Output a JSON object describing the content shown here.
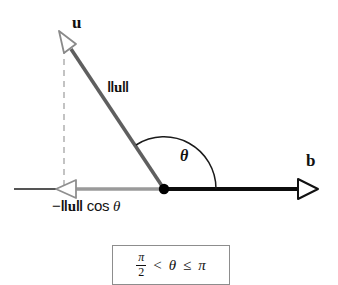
{
  "figure": {
    "type": "vector-angle-diagram",
    "background_color": "#ffffff",
    "labels": {
      "vector_u": "u",
      "vector_b": "b",
      "magnitude_u": "‖u‖",
      "angle": "θ",
      "projection": "−‖u‖ cos θ"
    },
    "projection_label_parts": {
      "minus": "−",
      "left_bar": "‖",
      "u": "u",
      "right_bar": "‖",
      "cos": " cos ",
      "theta": "θ"
    },
    "magnitude_label_parts": {
      "left_bar": "‖",
      "u": "u",
      "right_bar": "‖"
    },
    "condition": {
      "numerator": "π",
      "denominator": "2",
      "less_than": "<",
      "theta": "θ",
      "less_equal": "≤",
      "pi": "π"
    },
    "colors": {
      "vector_u_line": "#5f5f5f",
      "axis_black": "#0d0d0d",
      "projection_gray": "#9a9a9a",
      "dashed_gray": "#b5b5b5",
      "arc_black": "#1a1a1a",
      "box_border": "#8d8d8d",
      "origin_dot": "#000000"
    },
    "geometry": {
      "origin": {
        "x": 164,
        "y": 189
      },
      "u_tip": {
        "x": 63,
        "y": 39
      },
      "b_tip": {
        "x": 316,
        "y": 189
      },
      "projection_foot": {
        "x": 63,
        "y": 189
      },
      "axis_left_end": {
        "x": 14,
        "y": 189
      },
      "arc_radius": 52
    }
  }
}
